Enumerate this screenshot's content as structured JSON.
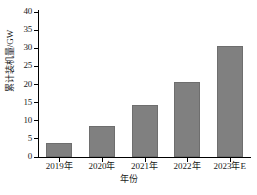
{
  "chart_data": {
    "type": "bar",
    "title": "",
    "categories": [
      "2019年",
      "2020年",
      "2021年",
      "2022年",
      "2023年E"
    ],
    "values": [
      3.9,
      8.5,
      14.3,
      20.8,
      30.6
    ],
    "xlabel": "年份",
    "ylabel": "累计装机量/GW",
    "ylim": [
      0,
      40
    ],
    "ytick_values": [
      0,
      5,
      10,
      15,
      20,
      25,
      30,
      35,
      40
    ],
    "ytick_labels": [
      "0",
      "5",
      "10",
      "15",
      "20",
      "25",
      "30",
      "35",
      "40"
    ],
    "grid": false,
    "legend": null,
    "series": [
      {
        "name": "累计装机量",
        "values": [
          3.9,
          8.5,
          14.3,
          20.8,
          30.6
        ]
      }
    ],
    "colors": {
      "bar_fill": "#808080",
      "bar_edge": "#6e6e6e",
      "axis": "#000000",
      "background": "#ffffff",
      "text": "#1a1a1a"
    }
  }
}
